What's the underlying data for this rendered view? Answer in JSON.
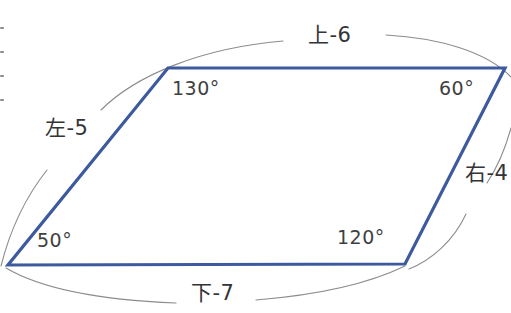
{
  "figure": {
    "type": "parallelogram-diagram",
    "shape_color": "#3d5a9e",
    "arc_color": "#8c8c90",
    "text_color": "#3a3a3a",
    "background_color": "#ffffff",
    "vertices": [
      {
        "name": "top-left",
        "x": 168,
        "y": 68
      },
      {
        "name": "top-right",
        "x": 505,
        "y": 68
      },
      {
        "name": "bottom-right",
        "x": 405,
        "y": 264
      },
      {
        "name": "bottom-left",
        "x": 8,
        "y": 265
      }
    ]
  },
  "angles": {
    "top_left": "130°",
    "top_right": "60°",
    "bottom_left": "50°",
    "bottom_right": "120°"
  },
  "sides": {
    "top": "上-6",
    "left": "左-5",
    "right": "右-4",
    "bottom": "下-7"
  },
  "icons": {
    "edge_tick": "tick-mark"
  }
}
